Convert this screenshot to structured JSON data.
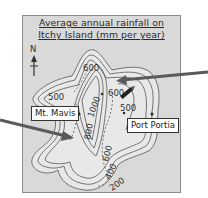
{
  "title": {
    "line1": "Average annual rainfall on",
    "line2": "Itchy Island (mm per year)"
  },
  "compass": {
    "label": "N",
    "icon": "north-arrow-icon"
  },
  "places": {
    "mountain": "Mt. Mavis",
    "port": "Port Portia"
  },
  "contours": {
    "c500_west": "500",
    "c600_north": "600",
    "c600_east": "600",
    "c500_east": "500",
    "c1000": "1000",
    "c800": "800",
    "c600_south": "600",
    "c400": "400",
    "c200": "200"
  },
  "colors": {
    "frame_bg": "#d9d9d9",
    "island_fill": "#e6e6e6",
    "contour_line": "#555555",
    "arrow": "#555555"
  }
}
